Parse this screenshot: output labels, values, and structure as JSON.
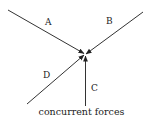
{
  "diagram": {
    "caption": "concurrent forces",
    "forces": [
      {
        "label": "A"
      },
      {
        "label": "B"
      },
      {
        "label": "C"
      },
      {
        "label": "D"
      }
    ]
  }
}
